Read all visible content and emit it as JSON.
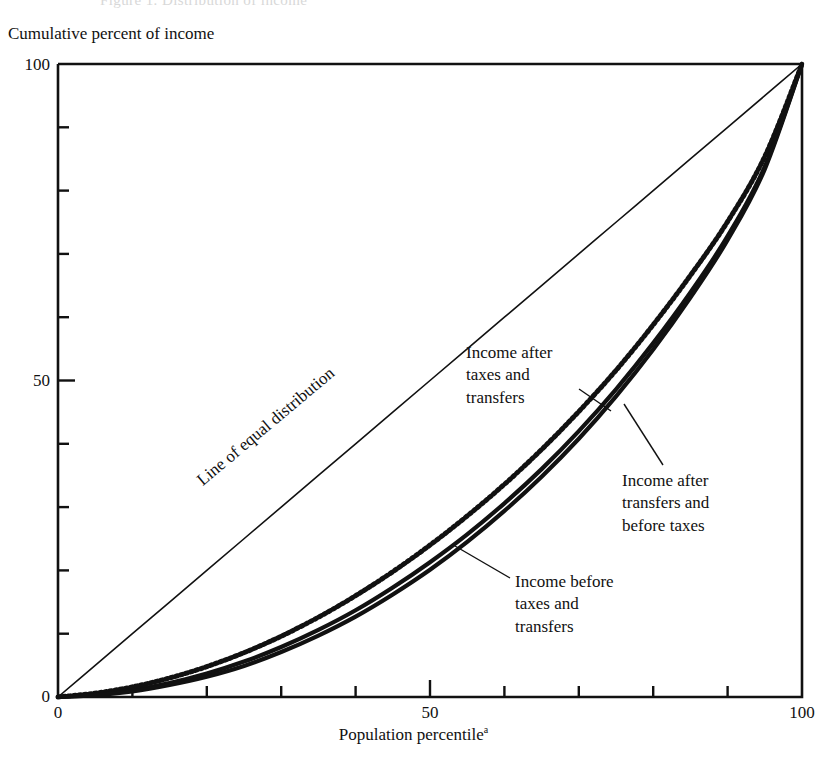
{
  "figure": {
    "scan_artifact_text": "Figure 1. Distribution of income",
    "y_axis_title": "Cumulative percent of income",
    "x_axis_title": "Population percentile",
    "x_axis_title_superscript": "a",
    "y_tick_labels": [
      "0",
      "50",
      "100"
    ],
    "x_tick_labels": [
      "0",
      "50",
      "100"
    ],
    "annotations": {
      "equal_line": "Line of equal distribution",
      "after_taxes_transfers": "Income after\ntaxes and\ntransfers",
      "after_transfers_before_taxes": "Income after\ntransfers and\nbefore taxes",
      "before_taxes_transfers": "Income before\ntaxes and\ntransfers"
    },
    "colors": {
      "ink": "#111111",
      "background": "#ffffff"
    }
  },
  "chart_data": {
    "type": "line",
    "title": "",
    "subtitle": "",
    "xlabel": "Population percentile",
    "ylabel": "Cumulative percent of income",
    "xlim": [
      0,
      100
    ],
    "ylim": [
      0,
      100
    ],
    "grid": false,
    "legend_position": "inline-annotations",
    "x": [
      0,
      5,
      10,
      15,
      20,
      25,
      30,
      35,
      40,
      45,
      50,
      55,
      60,
      65,
      70,
      75,
      80,
      85,
      90,
      95,
      100
    ],
    "series": [
      {
        "name": "Line of equal distribution",
        "style": "thin-solid",
        "values": [
          0,
          5,
          10,
          15,
          20,
          25,
          30,
          35,
          40,
          45,
          50,
          55,
          60,
          65,
          70,
          75,
          80,
          85,
          90,
          95,
          100
        ]
      },
      {
        "name": "Income after taxes and transfers",
        "style": "dotted-thick",
        "values": [
          0,
          0.6,
          1.6,
          3.0,
          4.8,
          7.0,
          9.6,
          12.6,
          16.0,
          19.8,
          24.0,
          28.6,
          33.6,
          39.1,
          45.1,
          51.6,
          58.8,
          66.6,
          75.1,
          85.4,
          100
        ]
      },
      {
        "name": "Income after transfers and before taxes",
        "style": "solid-thick",
        "values": [
          0,
          0.4,
          1.1,
          2.2,
          3.7,
          5.6,
          7.9,
          10.6,
          13.7,
          17.3,
          21.3,
          25.7,
          30.6,
          36.0,
          42.0,
          48.6,
          55.9,
          63.9,
          72.8,
          83.8,
          100
        ]
      },
      {
        "name": "Income before taxes and transfers",
        "style": "solid-thick",
        "values": [
          0,
          0.3,
          0.9,
          1.9,
          3.2,
          4.9,
          7.1,
          9.7,
          12.7,
          16.2,
          20.1,
          24.5,
          29.4,
          34.8,
          40.8,
          47.5,
          54.9,
          63.1,
          72.2,
          83.4,
          100
        ]
      }
    ]
  }
}
